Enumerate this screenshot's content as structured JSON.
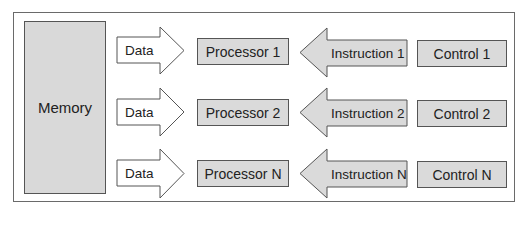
{
  "diagram": {
    "memory": {
      "label": "Memory"
    },
    "rows": [
      {
        "data_label": "Data",
        "processor": "Processor 1",
        "instruction": "Instruction 1",
        "control": "Control 1"
      },
      {
        "data_label": "Data",
        "processor": "Processor 2",
        "instruction": "Instruction 2",
        "control": "Control 2"
      },
      {
        "data_label": "Data",
        "processor": "Processor N",
        "instruction": "Instruction N",
        "control": "Control N"
      }
    ]
  },
  "colors": {
    "box_fill": "#dadada",
    "border": "#555555",
    "data_arrow_fill": "#ffffff",
    "instruction_arrow_fill": "#dadada"
  }
}
